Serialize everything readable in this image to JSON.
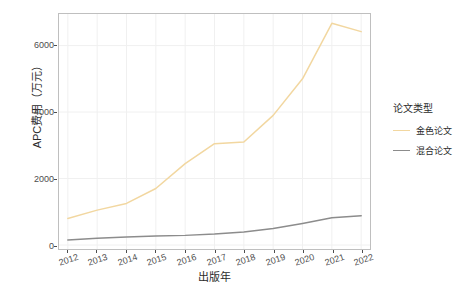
{
  "chart_data": {
    "type": "line",
    "title": "",
    "xlabel": "出版年",
    "ylabel": "APC费用（万元）",
    "x": [
      2012,
      2013,
      2014,
      2015,
      2016,
      2017,
      2018,
      2019,
      2020,
      2021,
      2022
    ],
    "xticklabels": [
      "2012",
      "2013",
      "2014",
      "2015",
      "2016",
      "2017",
      "2018",
      "2019",
      "2020",
      "2021",
      "2022"
    ],
    "yticklabels": [
      "0",
      "2000",
      "4000",
      "6000"
    ],
    "yticks": [
      0,
      2000,
      4000,
      6000
    ],
    "ylim": [
      -120,
      6950
    ],
    "xlim": [
      2011.7,
      2022.3
    ],
    "grid": true,
    "legend_position": "right",
    "legend_title": "论文类型",
    "series": [
      {
        "name": "金色论文",
        "color": "#F2D7A0",
        "values": [
          800,
          1050,
          1250,
          1700,
          2450,
          3050,
          3100,
          3900,
          5000,
          6670,
          6420
        ]
      },
      {
        "name": "混合论文",
        "color": "#8C8C8C",
        "values": [
          150,
          200,
          240,
          270,
          290,
          330,
          390,
          500,
          650,
          820,
          880
        ]
      }
    ]
  },
  "axes": {
    "y_title": "APC费用（万元）",
    "x_title": "出版年"
  },
  "legend": {
    "title": "论文类型",
    "items": [
      {
        "label": "金色论文",
        "color": "#F2D7A0"
      },
      {
        "label": "混合论文",
        "color": "#8C8C8C"
      }
    ]
  },
  "colors": {
    "panel_border": "#bfbfbf",
    "grid": "#f0f0f0",
    "tick_text": "#4d4d4d",
    "title_text": "#2b2b2b",
    "background": "#ffffff"
  }
}
